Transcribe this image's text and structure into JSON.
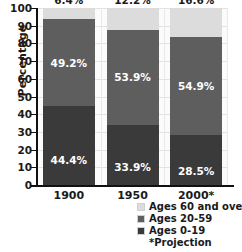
{
  "chart_data": {
    "type": "bar",
    "stacked": true,
    "title": "",
    "subtitle": "",
    "xlabel": "",
    "ylabel": "Percentage",
    "categories": [
      "1900",
      "1950",
      "2000*"
    ],
    "ylim": [
      0,
      100
    ],
    "yticks": [
      0,
      10,
      20,
      30,
      40,
      50,
      60,
      70,
      80,
      90,
      100
    ],
    "ytick_labels": [
      "0",
      "10",
      "20",
      "30",
      "40",
      "50",
      "60",
      "70",
      "80",
      "90",
      "100"
    ],
    "grid": true,
    "legend_position": "bottom-right",
    "series": [
      {
        "name": "Ages 0-19",
        "color": "#3a3a3a",
        "values": [
          44.4,
          33.9,
          28.5
        ],
        "labels": [
          "44.4%",
          "33.9%",
          "28.5%"
        ]
      },
      {
        "name": "Ages 20-59",
        "color": "#5e5e5e",
        "values": [
          49.2,
          53.9,
          54.9
        ],
        "labels": [
          "49.2%",
          "53.9%",
          "54.9%"
        ]
      },
      {
        "name": "Ages 60 and over",
        "color": "#dcdcdc",
        "values": [
          6.4,
          12.2,
          16.6
        ],
        "labels": [
          "6.4%",
          "12.2%",
          "16.6%"
        ]
      }
    ],
    "annotations": [
      "*Projection"
    ]
  },
  "axes": {
    "ylabel": "Percentage",
    "ytick_labels": [
      "100",
      "90",
      "80",
      "70",
      "60",
      "50",
      "40",
      "30",
      "20",
      "10",
      "0"
    ],
    "xtick_labels": [
      "1900",
      "1950",
      "2000*"
    ]
  },
  "legend": {
    "items": [
      {
        "label": "Ages 60 and over",
        "color": "#dcdcdc"
      },
      {
        "label": "Ages 20-59",
        "color": "#5e5e5e"
      },
      {
        "label": "Ages 0-19",
        "color": "#3a3a3a"
      }
    ],
    "note": "*Projection"
  },
  "colors": {
    "ages_60_plus": "#dcdcdc",
    "ages_20_59": "#5e5e5e",
    "ages_0_19": "#3a3a3a",
    "plot_background": "#fbfbfb",
    "axis": "#111111",
    "text": "#1a1a1a"
  }
}
